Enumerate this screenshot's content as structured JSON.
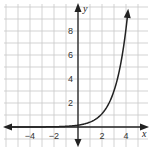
{
  "chart_data": {
    "type": "line",
    "title": "",
    "xlabel": "x",
    "ylabel": "y",
    "xlim": [
      -6,
      5.5
    ],
    "ylim": [
      -1,
      10
    ],
    "grid": true,
    "x_ticks": [
      -4,
      -2,
      2,
      4
    ],
    "y_ticks": [
      2,
      4,
      6,
      8
    ],
    "x_tick_labels": [
      "−4",
      "−2",
      "2",
      "4"
    ],
    "y_tick_labels": [
      "2",
      "4",
      "6",
      "8"
    ],
    "series": [
      {
        "name": "exponential curve",
        "description": "exponential growth curve approaching 0 as x decreases, arrow at top right",
        "x": [
          -6,
          -4,
          -2,
          -1,
          0,
          1,
          2,
          2.5,
          3,
          3.5,
          4,
          4.25
        ],
        "y": [
          0.0,
          0.0,
          0.02,
          0.06,
          0.15,
          0.41,
          1.1,
          1.8,
          3.0,
          5.0,
          8.2,
          10.5
        ]
      }
    ],
    "axis_arrows": {
      "x": "both",
      "y": "both"
    },
    "colors": {
      "grid": "#c8c8c8",
      "axis": "#222222",
      "curve": "#222222"
    }
  }
}
